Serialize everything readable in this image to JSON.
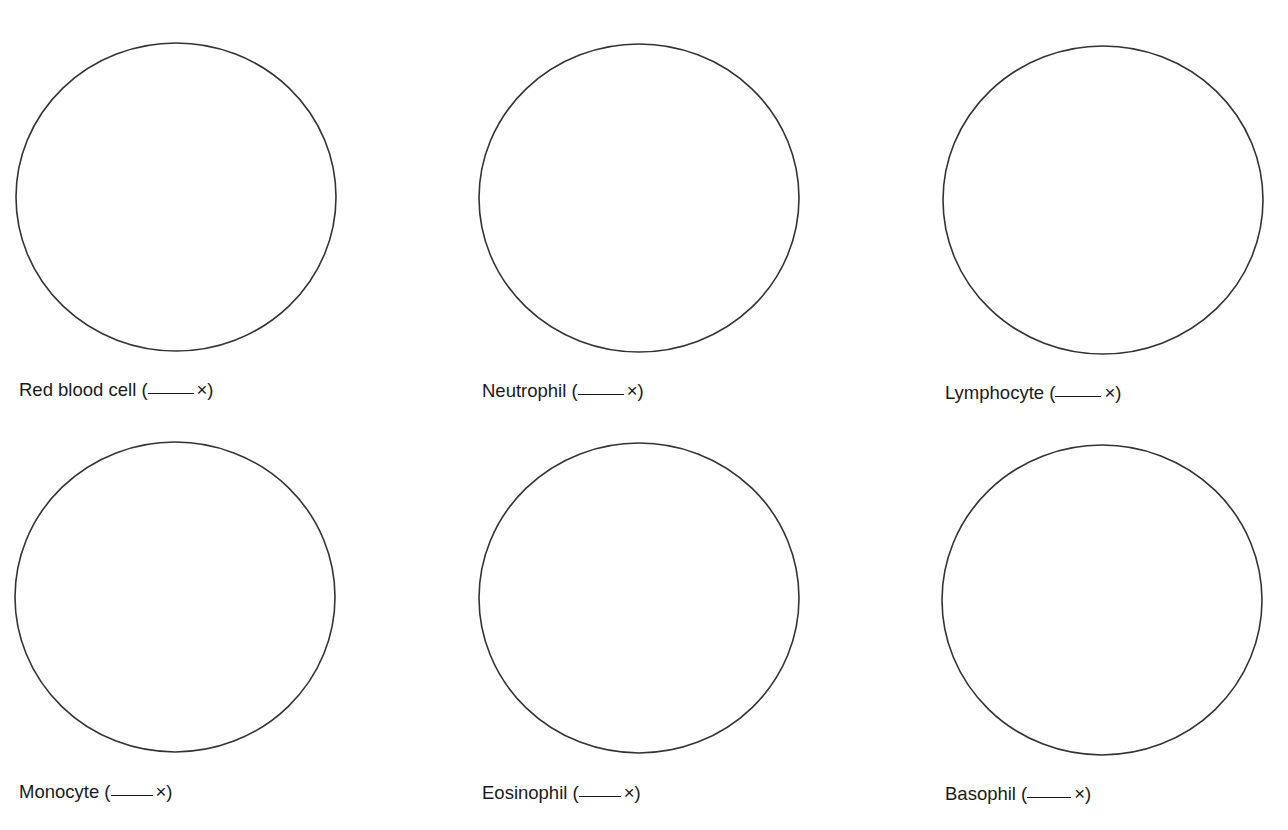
{
  "figure": {
    "background": "#ffffff",
    "stroke_color": "#333333",
    "cells": [
      {
        "id": "red-blood-cell",
        "name": "Red blood cell",
        "open": " (",
        "blank": "",
        "close": "×)",
        "cx": 176,
        "cy": 197,
        "rx": 160,
        "ry": 154,
        "label_x": 19,
        "label_y": 381,
        "blank_w": 46
      },
      {
        "id": "neutrophil",
        "name": "Neutrophil",
        "open": " (",
        "blank": "",
        "close": "×)",
        "cx": 639,
        "cy": 198,
        "rx": 160,
        "ry": 154,
        "label_x": 482,
        "label_y": 382,
        "blank_w": 46
      },
      {
        "id": "lymphocyte",
        "name": "Lymphocyte",
        "open": " (",
        "blank": "",
        "close": "×)",
        "cx": 1103,
        "cy": 200,
        "rx": 160,
        "ry": 154,
        "label_x": 945,
        "label_y": 384,
        "blank_w": 46
      },
      {
        "id": "monocyte",
        "name": "Monocyte",
        "open": " (",
        "blank": "",
        "close": "×)",
        "cx": 175,
        "cy": 597,
        "rx": 160,
        "ry": 155,
        "label_x": 19,
        "label_y": 783,
        "blank_w": 42
      },
      {
        "id": "eosinophil",
        "name": "Eosinophil",
        "open": " (",
        "blank": "",
        "close": "×)",
        "cx": 639,
        "cy": 598,
        "rx": 160,
        "ry": 155,
        "label_x": 482,
        "label_y": 784,
        "blank_w": 42
      },
      {
        "id": "basophil",
        "name": "Basophil",
        "open": " (",
        "blank": "",
        "close": "×)",
        "cx": 1102,
        "cy": 600,
        "rx": 160,
        "ry": 155,
        "label_x": 945,
        "label_y": 785,
        "blank_w": 44
      }
    ]
  }
}
